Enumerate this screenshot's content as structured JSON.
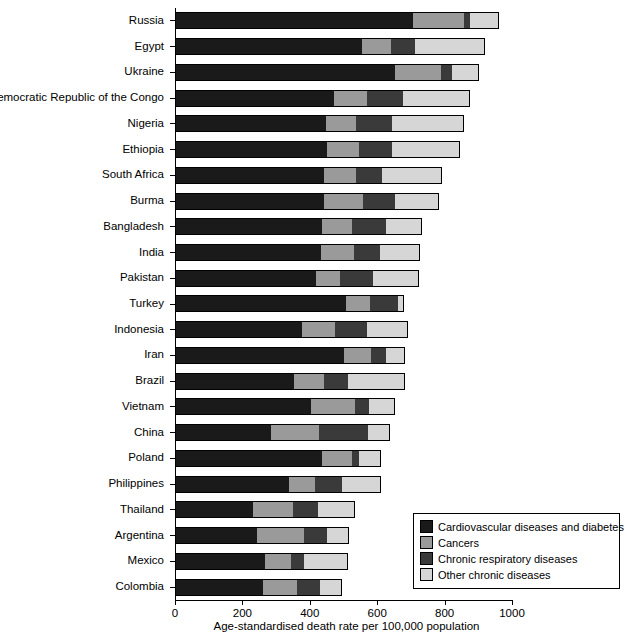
{
  "chart_data": {
    "type": "bar",
    "orientation": "horizontal",
    "stacked": true,
    "title": "",
    "xlabel": "Age-standardised death rate per 100,000 population",
    "ylabel": "",
    "xlim": [
      0,
      1000
    ],
    "xticks": [
      0,
      200,
      400,
      600,
      800,
      1000
    ],
    "xticklabels": [
      "0",
      "200",
      "400",
      "600",
      "800",
      "1000"
    ],
    "grid": false,
    "legend_position": "lower right",
    "categories": [
      "Russia",
      "Egypt",
      "Ukraine",
      "Democratic Republic of the Congo",
      "Nigeria",
      "Ethiopia",
      "South Africa",
      "Burma",
      "Bangladesh",
      "India",
      "Pakistan",
      "Turkey",
      "Indonesia",
      "Iran",
      "Brazil",
      "Vietnam",
      "China",
      "Poland",
      "Philippines",
      "Thailand",
      "Argentina",
      "Mexico",
      "Colombia"
    ],
    "series": [
      {
        "name": "Cardiovascular diseases and diabetes",
        "color": "#1a1a1a",
        "values": [
          703,
          553,
          650,
          470,
          445,
          447,
          440,
          440,
          432,
          430,
          415,
          505,
          375,
          498,
          350,
          400,
          282,
          432,
          335,
          228,
          240,
          265,
          258
        ]
      },
      {
        "name": "Cancers",
        "color": "#9a9a9a",
        "values": [
          152,
          85,
          137,
          98,
          90,
          95,
          95,
          114,
          90,
          98,
          72,
          70,
          96,
          82,
          90,
          130,
          142,
          90,
          78,
          120,
          140,
          76,
          100
        ]
      },
      {
        "name": "Chronic respiratory diseases",
        "color": "#3a3a3a",
        "values": [
          17,
          70,
          32,
          105,
          105,
          98,
          75,
          96,
          102,
          76,
          97,
          85,
          95,
          42,
          70,
          43,
          146,
          22,
          80,
          73,
          68,
          40,
          70
        ]
      },
      {
        "name": "Other chronic diseases",
        "color": "#d6d6d6",
        "values": [
          84,
          206,
          77,
          197,
          213,
          200,
          175,
          127,
          104,
          116,
          133,
          15,
          120,
          55,
          168,
          73,
          62,
          60,
          112,
          108,
          62,
          126,
          62
        ]
      }
    ],
    "totals": [
      956,
      914,
      896,
      870,
      853,
      840,
      785,
      777,
      728,
      720,
      717,
      675,
      686,
      677,
      678,
      646,
      632,
      604,
      605,
      529,
      510,
      507,
      490
    ]
  },
  "legend": {
    "items": [
      {
        "label": "Cardiovascular diseases and diabetes",
        "swatch": "#1a1a1a"
      },
      {
        "label": "Cancers",
        "swatch": "#9a9a9a"
      },
      {
        "label": "Chronic respiratory diseases",
        "swatch": "#3a3a3a"
      },
      {
        "label": "Other chronic diseases",
        "swatch": "#d6d6d6"
      }
    ]
  }
}
